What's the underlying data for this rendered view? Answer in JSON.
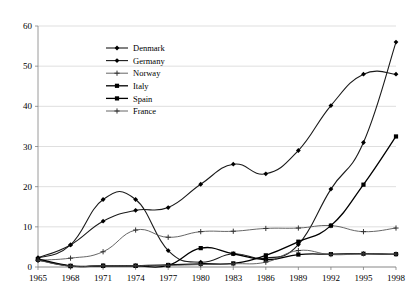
{
  "chart_data": {
    "type": "line",
    "title": "",
    "subtitle": "",
    "xlabel": "",
    "ylabel": "",
    "xlim": [
      1965,
      1998
    ],
    "ylim": [
      0,
      60
    ],
    "yticks": [
      0,
      10,
      20,
      30,
      40,
      50,
      60
    ],
    "grid": true,
    "legend_position": "upper-left-inside",
    "x": [
      1965,
      1968,
      1971,
      1974,
      1977,
      1980,
      1983,
      1986,
      1989,
      1992,
      1995,
      1998
    ],
    "categories": [
      "1965",
      "1968",
      "1971",
      "1974",
      "1977",
      "1980",
      "1983",
      "1986",
      "1989",
      "1992",
      "1995",
      "1998"
    ],
    "series": [
      {
        "name": "Denmark",
        "marker": "diamond",
        "values": [
          2.3,
          5.5,
          11.4,
          14.1,
          14.8,
          20.6,
          25.6,
          23.2,
          29.0,
          40.2,
          48.0,
          48.0
        ]
      },
      {
        "name": "Germany",
        "marker": "diamond",
        "values": [
          2.2,
          5.5,
          16.8,
          16.8,
          4.1,
          1.2,
          3.3,
          2.2,
          5.6,
          19.4,
          31.0,
          56.0
        ]
      },
      {
        "name": "Norway",
        "marker": "plus",
        "values": [
          1.7,
          2.2,
          3.8,
          9.2,
          7.4,
          8.8,
          8.9,
          9.6,
          9.7,
          10.3,
          8.8,
          9.7
        ]
      },
      {
        "name": "Italy",
        "marker": "square",
        "values": [
          2.0,
          0.3,
          0.3,
          0.3,
          0.5,
          0.8,
          0.9,
          2.9,
          6.3,
          10.3,
          20.5,
          32.5
        ]
      },
      {
        "name": "Spain",
        "marker": "square",
        "values": [
          1.8,
          0.2,
          0.3,
          0.3,
          0.4,
          4.7,
          3.3,
          1.8,
          3.1,
          3.2,
          3.3,
          3.2
        ]
      },
      {
        "name": "France",
        "marker": "plus",
        "values": [
          1.7,
          0.2,
          0.3,
          0.3,
          0.4,
          0.6,
          0.8,
          1.2,
          4.1,
          3.1,
          3.3,
          3.2
        ]
      }
    ]
  },
  "axis": {
    "y_ticklabels": [
      "0",
      "10",
      "20",
      "30",
      "40",
      "50",
      "60"
    ],
    "x_ticklabels": [
      "1965",
      "1968",
      "1971",
      "1974",
      "1977",
      "1980",
      "1983",
      "1986",
      "1989",
      "1992",
      "1995",
      "1998"
    ]
  },
  "legend": {
    "items": [
      {
        "label": "Denmark"
      },
      {
        "label": "Germany"
      },
      {
        "label": "Norway"
      },
      {
        "label": "Italy"
      },
      {
        "label": "Spain"
      },
      {
        "label": "France"
      }
    ]
  },
  "colors": {
    "line": "#111111",
    "thin_line": "#555555",
    "grid": "#c9c9c9",
    "axis": "#808080",
    "text": "#000000",
    "background": "#ffffff"
  }
}
